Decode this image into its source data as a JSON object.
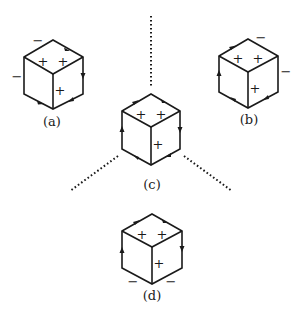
{
  "figure": {
    "cubes": [
      {
        "id": "a",
        "label": "(a)",
        "face_signs": [
          "+",
          "+",
          "+"
        ],
        "edge_signs": [
          "−",
          "−"
        ]
      },
      {
        "id": "b",
        "label": "(b)",
        "face_signs": [
          "+",
          "+",
          "+"
        ],
        "edge_signs": [
          "−",
          "−"
        ]
      },
      {
        "id": "c",
        "label": "(c)",
        "face_signs": [
          "+",
          "+",
          "+"
        ],
        "edge_signs": []
      },
      {
        "id": "d",
        "label": "(d)",
        "face_signs": [
          "+",
          "+",
          "+"
        ],
        "edge_signs": [
          "−",
          "−"
        ]
      }
    ],
    "colors": {
      "ink": "#1a1a1a",
      "background": "#ffffff"
    }
  }
}
